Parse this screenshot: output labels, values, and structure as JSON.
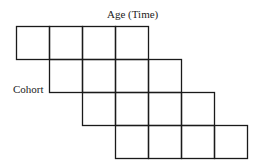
{
  "labels": {
    "age": "Age (Time)",
    "cohort": "Cohort"
  },
  "grid": {
    "rows": 4,
    "cells_per_row": 4,
    "row_offset": 1,
    "cell_size": 33,
    "origin_x": 16,
    "origin_y": 26,
    "line_color": "#1a1a1a"
  }
}
